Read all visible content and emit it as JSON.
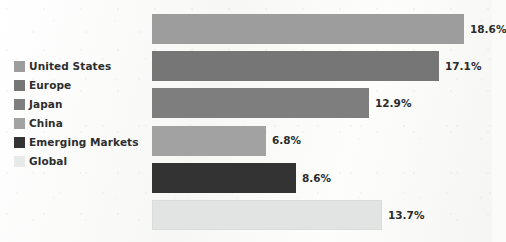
{
  "chart_data": {
    "type": "bar",
    "orientation": "horizontal",
    "title": "",
    "subtitle": "",
    "xlabel": "",
    "ylabel": "",
    "grid": false,
    "legend_position": "left",
    "xlim": [
      0,
      20
    ],
    "value_suffix": "%",
    "categories": [
      "United States",
      "Europe",
      "Japan",
      "China",
      "Emerging Markets",
      "Global"
    ],
    "values": [
      18.6,
      17.1,
      12.9,
      6.8,
      8.6,
      13.7
    ],
    "value_labels": [
      "18.6%",
      "17.1%",
      "12.9%",
      "6.8%",
      "8.6%",
      "13.7%"
    ],
    "colors": [
      "#9d9d9d",
      "#767676",
      "#7e7e7e",
      "#a2a2a2",
      "#333333",
      "#e2e4e3"
    ],
    "series": [
      {
        "name": "",
        "points": [
          {
            "category": "United States",
            "value": 18.6,
            "label": "18.6%",
            "color": "#9d9d9d"
          },
          {
            "category": "Europe",
            "value": 17.1,
            "label": "17.1%",
            "color": "#767676"
          },
          {
            "category": "Japan",
            "value": 12.9,
            "label": "12.9%",
            "color": "#7e7e7e"
          },
          {
            "category": "China",
            "value": 6.8,
            "label": "6.8%",
            "color": "#a2a2a2"
          },
          {
            "category": "Emerging Markets",
            "value": 8.6,
            "label": "8.6%",
            "color": "#333333"
          },
          {
            "category": "Global",
            "value": 13.7,
            "label": "13.7%",
            "color": "#e2e4e3"
          }
        ]
      }
    ]
  },
  "legend": {
    "items": [
      {
        "label": "United States",
        "color": "#9d9d9d"
      },
      {
        "label": "Europe",
        "color": "#767676"
      },
      {
        "label": "Japan",
        "color": "#7e7e7e"
      },
      {
        "label": "China",
        "color": "#a2a2a2"
      },
      {
        "label": "Emerging Markets",
        "color": "#333333"
      },
      {
        "label": "Global",
        "color": "#e8eaea"
      }
    ]
  },
  "theme": {
    "background": "#fbfbfa",
    "text_color": "#2e2e2e"
  }
}
